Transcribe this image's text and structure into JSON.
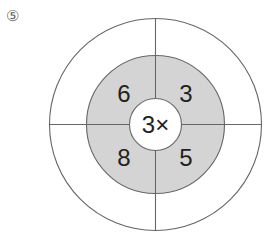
{
  "problem": {
    "label": "⑤",
    "center": "3×",
    "numbers": {
      "top_left": "6",
      "top_right": "3",
      "bottom_left": "8",
      "bottom_right": "5"
    }
  },
  "colors": {
    "ring_fill": "#d4d4d4",
    "stroke": "#666666"
  }
}
